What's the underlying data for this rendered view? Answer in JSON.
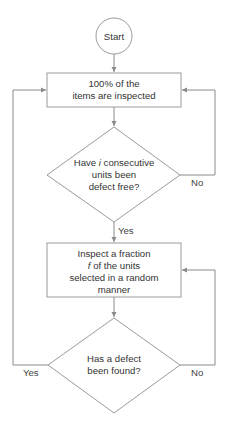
{
  "diagram": {
    "type": "flowchart",
    "nodes": {
      "start": {
        "shape": "circle",
        "text": "Start"
      },
      "inspect_all": {
        "shape": "rectangle",
        "lines": [
          "100% of the",
          "items are inspected"
        ]
      },
      "decision_consecutive": {
        "shape": "diamond",
        "lines": [
          "Have i consecutive",
          "units been",
          "defect free?"
        ],
        "italic_word": "i"
      },
      "inspect_fraction": {
        "shape": "rectangle",
        "lines": [
          "Inspect a fraction",
          "f of the units",
          "selected in a random",
          "manner"
        ],
        "italic_word": "f"
      },
      "decision_defect": {
        "shape": "diamond",
        "lines": [
          "Has a defect",
          "been found?"
        ]
      }
    },
    "edges": [
      {
        "from": "start",
        "to": "inspect_all",
        "label": ""
      },
      {
        "from": "inspect_all",
        "to": "decision_consecutive",
        "label": ""
      },
      {
        "from": "decision_consecutive",
        "to": "inspect_fraction",
        "label": "Yes"
      },
      {
        "from": "decision_consecutive",
        "to": "inspect_all",
        "label": "No"
      },
      {
        "from": "inspect_fraction",
        "to": "decision_defect",
        "label": ""
      },
      {
        "from": "decision_defect",
        "to": "inspect_fraction",
        "label": "No"
      },
      {
        "from": "decision_defect",
        "to": "inspect_all",
        "label": "Yes"
      }
    ],
    "labels": {
      "yes_1": "Yes",
      "no_1": "No",
      "yes_2": "Yes",
      "no_2": "No"
    },
    "colors": {
      "line": "#8a8a8a",
      "shape_border": "#9a9a9a",
      "text": "#333333",
      "background": "#ffffff"
    }
  }
}
